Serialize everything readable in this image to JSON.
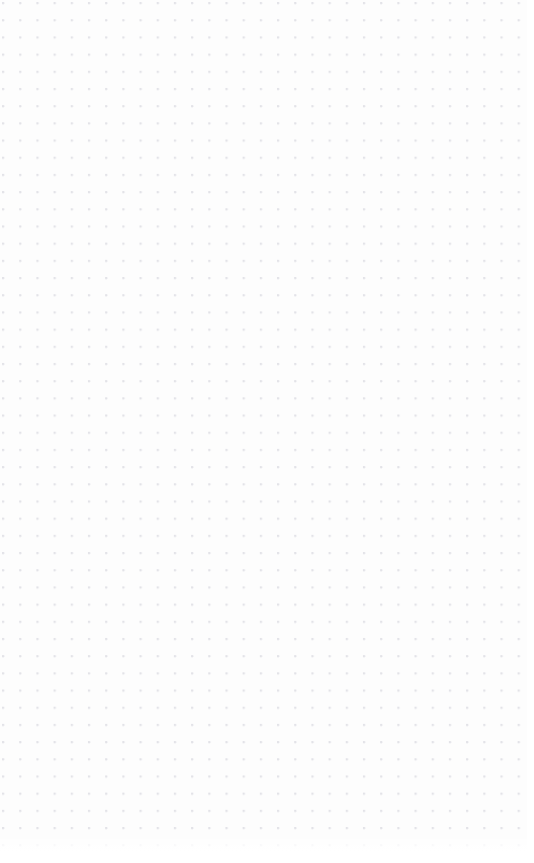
{
  "app": {
    "surface_type": "dot-grid-canvas",
    "empty_state_label": ""
  },
  "canvas": {
    "width": 534,
    "height": 863,
    "background_color": "#fdfdfd",
    "dot_color": "#e3e3e8",
    "dot_spacing_px": 17.2,
    "dot_radius_px": 1.1,
    "grid_origin_x_px": 3,
    "grid_origin_y_px": 3,
    "dot_columns": 31,
    "dot_rows": 49,
    "objects": []
  }
}
